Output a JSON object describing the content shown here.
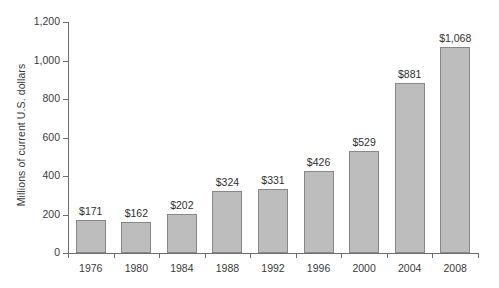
{
  "chart_data": {
    "type": "bar",
    "title": "",
    "subtitle": "",
    "xlabel": "",
    "ylabel": "Millions of current U.S. dollars",
    "categories": [
      "1976",
      "1980",
      "1984",
      "1988",
      "1992",
      "1996",
      "2000",
      "2004",
      "2008"
    ],
    "values": [
      171,
      162,
      202,
      324,
      331,
      426,
      529,
      881,
      1068
    ],
    "data_labels": [
      "$171",
      "$162",
      "$202",
      "$324",
      "$331",
      "$426",
      "$529",
      "$881",
      "$1,068"
    ],
    "ylim": [
      0,
      1200
    ],
    "yticks": [
      0,
      200,
      400,
      600,
      800,
      1000,
      1200
    ],
    "ytick_labels": [
      "0",
      "200",
      "400",
      "600",
      "800",
      "1,000",
      "1,200"
    ],
    "grid": false,
    "legend": null,
    "legend_position": "none",
    "bar_color": "#bdbdbd",
    "bar_border_color": "#878787",
    "axis_color": "#6e6e6e",
    "text_color": "#3a3a3a",
    "background_color": "#ffffff"
  }
}
